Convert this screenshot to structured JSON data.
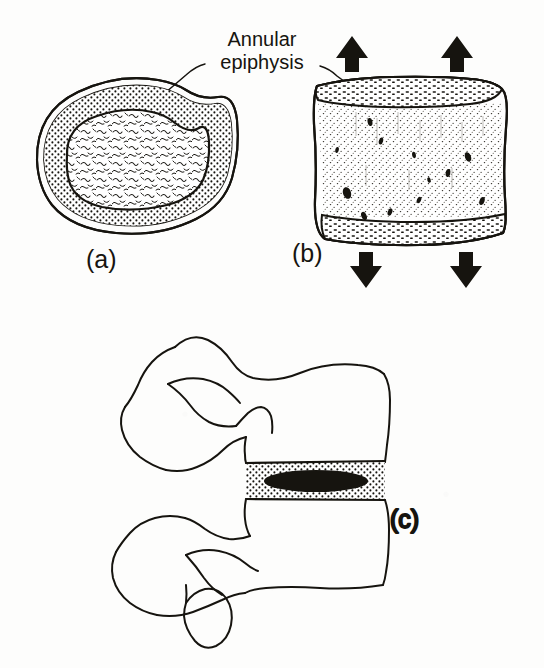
{
  "figure": {
    "title": "NORMAL GROWTH IN THE SPINE",
    "title_visibility": "cropped-at-top-edge",
    "background_color": "#fdfdfc",
    "ink_color": "#16140f",
    "callouts": [
      {
        "name": "annular-epiphysis",
        "line1": "Annular",
        "line2": "epiphysis",
        "points_to": [
          "panel-a",
          "panel-b"
        ]
      }
    ],
    "panels": [
      {
        "id": "a",
        "label": "(a)",
        "view": "superior view of vertebral body",
        "features": [
          "annular epiphysis ring (stippled)",
          "cancellous bone centre (hatched)"
        ]
      },
      {
        "id": "b",
        "label": "(b)",
        "view": "anterior view of vertebral body",
        "features": [
          "superior annular epiphysis band",
          "inferior annular epiphysis band",
          "stippled vertebral body",
          "growth direction arrows"
        ],
        "arrows": [
          {
            "name": "growth-arrow-up-left",
            "direction": "up"
          },
          {
            "name": "growth-arrow-up-right",
            "direction": "up"
          },
          {
            "name": "growth-arrow-down-left",
            "direction": "down"
          },
          {
            "name": "growth-arrow-down-right",
            "direction": "down"
          }
        ]
      },
      {
        "id": "c",
        "label": "(c)",
        "view": "lateral view of two lumbar vertebrae",
        "features": [
          "upper vertebral body",
          "lower vertebral body",
          "intervertebral disc (stippled annulus fibrosus)",
          "nucleus pulposus (solid black ellipse)",
          "spinous processes",
          "articular processes"
        ]
      }
    ]
  }
}
